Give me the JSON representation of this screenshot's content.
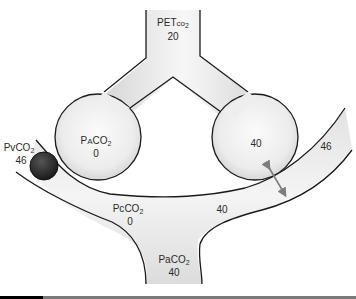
{
  "diagram": {
    "labels": {
      "petco2": {
        "prefix": "PET",
        "small": "co",
        "subscript": "2",
        "value": "20"
      },
      "pAco2_left": {
        "prefix": "P",
        "small": "A",
        "main": "CO",
        "subscript": "2",
        "value": "0"
      },
      "pAco2_right": {
        "value": "40"
      },
      "pvco2": {
        "prefix": "Pv",
        "main": "CO",
        "subscript": "2",
        "value": "46"
      },
      "pcco2": {
        "prefix": "Pc",
        "main": "CO",
        "subscript": "2",
        "value": "0"
      },
      "capillary_right_venous": {
        "value": "46"
      },
      "capillary_right_end": {
        "value": "40"
      },
      "paco2": {
        "prefix": "Pa",
        "main": "CO",
        "subscript": "2",
        "value": "40"
      }
    },
    "elements": {
      "trachea": "conducting airway",
      "left_alveolus": "dead space alveolus (PACO2 0)",
      "right_alveolus": "perfused alveolus (PACO2 40)",
      "blood_clot": "embolus blocking left capillary",
      "diffusion_arrow": "gas exchange arrow"
    },
    "colors": {
      "fill_light": "#f4f4f4",
      "fill_shade": "#d6d6d6",
      "outline": "#1a1a1a",
      "embolus": "#2b2b2b",
      "arrow": "#7d7d7d",
      "bar_gray": "#7a7a7a",
      "bar_dark": "#000000"
    }
  }
}
